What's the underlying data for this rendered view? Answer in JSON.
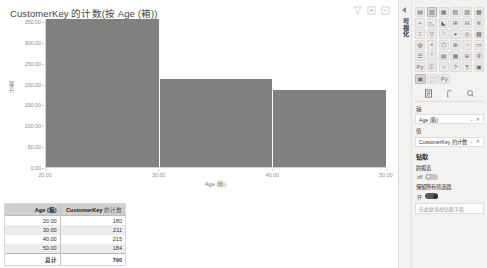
{
  "chart_data": {
    "type": "bar",
    "title": "CustomerKey 的计数(按 Age (箱))",
    "xlabel": "Age (箱)",
    "ylabel": "计数",
    "categories": [
      "20.00",
      "30.00",
      "40.00",
      "50.00"
    ],
    "x_ticks": [
      "20.00",
      "30.00",
      "40.00",
      "50.00"
    ],
    "y_ticks": [
      "350.00",
      "300.00",
      "250.00",
      "200.00",
      "150.00",
      "100.00",
      "50.00",
      "0.00"
    ],
    "ylim": [
      0,
      355
    ],
    "xlim": [
      20,
      50
    ],
    "grid": false,
    "legend": "none",
    "bar_color": "#808080",
    "bins": [
      {
        "bin_start": "20.00",
        "value": 355
      },
      {
        "bin_start": "30.00",
        "value": 210
      },
      {
        "bin_start": "40.00",
        "value": 185
      }
    ]
  },
  "visual_header": {
    "icons": [
      "filter-icon",
      "focus-mode-icon",
      "more-options-icon"
    ]
  },
  "table_visual": {
    "columns": [
      "Age (箱)",
      "CustomerKey"
    ],
    "column2_sub": "的计数",
    "rows": [
      {
        "age": "20.00",
        "count": "180"
      },
      {
        "age": "30.00",
        "count": "211"
      },
      {
        "age": "40.00",
        "count": "215"
      },
      {
        "age": "50.00",
        "count": "184"
      }
    ],
    "total_label": "总计",
    "total_value": "790"
  },
  "right_panel": {
    "rail_label": "可视化",
    "viz_icons": [
      "stacked-bar-chart-icon",
      "stacked-column-chart-icon",
      "clustered-bar-chart-icon",
      "clustered-column-chart-icon",
      "100-stacked-bar-icon",
      "100-stacked-column-icon",
      "line-chart-icon",
      "area-chart-icon",
      "stacked-area-icon",
      "line-stacked-column-icon",
      "line-clustered-column-icon",
      "ribbon-chart-icon",
      "waterfall-chart-icon",
      "funnel-chart-icon",
      "scatter-chart-icon",
      "pie-chart-icon",
      "donut-chart-icon",
      "treemap-icon",
      "map-icon",
      "filled-map-icon",
      "shape-map-icon",
      "arcgis-map-icon",
      "gauge-icon",
      "card-icon",
      "multi-row-card-icon",
      "kpi-icon",
      "slicer-icon",
      "table-icon",
      "matrix-icon",
      "r-script-visual-icon",
      "python-visual-icon",
      "key-influencers-icon",
      "decomposition-tree-icon",
      "q-and-a-icon",
      "smart-narrative-icon",
      "paginated-report-icon"
    ],
    "viz_extra_icons": [
      "get-more-visuals-icon",
      "import-visual-icon",
      "python-icon"
    ],
    "selected_viz": "column-chart-icon",
    "panel_tabs": [
      "fields-tab-icon",
      "format-tab-icon",
      "analytics-tab-icon"
    ],
    "axis_section_label": "轴",
    "axis_field": "Age (箱)",
    "values_section_label": "值",
    "values_field": "CustomerKey 的计数",
    "drill_section_label": "钻取",
    "cross_report_label": "跨报表",
    "cross_report_state": "off",
    "keep_all_filters_label": "保留所有筛选器",
    "keep_all_filters_state": "on",
    "keep_all_filters_value": "开",
    "drop_zone_text": "在此处添加钻取字段",
    "field_icons": [
      "chevron-down-icon",
      "remove-field-icon"
    ]
  }
}
